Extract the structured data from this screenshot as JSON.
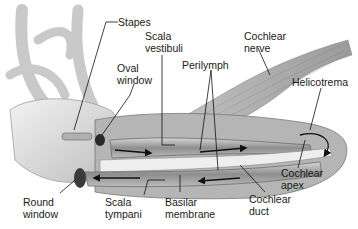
{
  "diagram": {
    "palette": {
      "background": "#ffffff",
      "tissue_light": "#d9d9d9",
      "tissue_mid": "#a8a8a8",
      "tissue_dark": "#6e6e6e",
      "line": "#1a1a1a"
    },
    "labels": [
      {
        "id": "stapes",
        "text": "Stapes"
      },
      {
        "id": "scala-vestibuli",
        "text": "Scala\nvestibuli"
      },
      {
        "id": "cochlear-nerve",
        "text": "Cochlear\nnerve"
      },
      {
        "id": "oval-window",
        "text": "Oval\nwindow"
      },
      {
        "id": "perilymph",
        "text": "Perilymph"
      },
      {
        "id": "helicotrema",
        "text": "Helicotrema"
      },
      {
        "id": "cochlear-apex",
        "text": "Cochlear\napex"
      },
      {
        "id": "round-window",
        "text": "Round\nwindow"
      },
      {
        "id": "scala-tympani",
        "text": "Scala\ntympani"
      },
      {
        "id": "basilar-membrane",
        "text": "Basilar\nmembrane"
      },
      {
        "id": "cochlear-duct",
        "text": "Cochlear\nduct"
      }
    ]
  }
}
